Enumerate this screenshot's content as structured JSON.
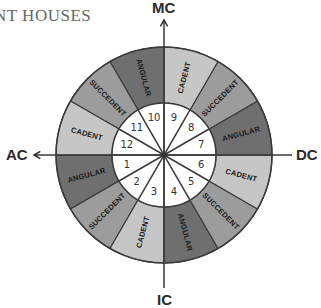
{
  "title_visible": "NT HOUSES",
  "axes": {
    "top": "MC",
    "bottom": "IC",
    "left": "AC",
    "right": "DC"
  },
  "colors": {
    "angular": "#6f6f6f",
    "succedent": "#9c9c9c",
    "cadent": "#c6c6c6",
    "inner": "#ffffff",
    "lines": "#3a3a3a"
  },
  "houses": [
    {
      "number": "1",
      "type": "ANGULAR"
    },
    {
      "number": "2",
      "type": "SUCCEDENT"
    },
    {
      "number": "3",
      "type": "CADENT"
    },
    {
      "number": "4",
      "type": "ANGULAR"
    },
    {
      "number": "5",
      "type": "SUCCEDENT"
    },
    {
      "number": "6",
      "type": "CADENT"
    },
    {
      "number": "7",
      "type": "ANGULAR"
    },
    {
      "number": "8",
      "type": "SUCCEDENT"
    },
    {
      "number": "9",
      "type": "CADENT"
    },
    {
      "number": "10",
      "type": "ANGULAR"
    },
    {
      "number": "11",
      "type": "SUCCEDENT"
    },
    {
      "number": "12",
      "type": "CADENT"
    }
  ]
}
